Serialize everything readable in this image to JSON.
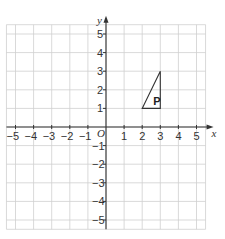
{
  "diagram": {
    "type": "coordinate-grid",
    "x_axis": {
      "label": "x",
      "min": -5,
      "max": 5,
      "ticks": [
        "-5",
        "-4",
        "-3",
        "-2",
        "-1",
        "1",
        "2",
        "3",
        "4",
        "5"
      ]
    },
    "y_axis": {
      "label": "y",
      "min": -5,
      "max": 5,
      "ticks": [
        "5",
        "4",
        "3",
        "2",
        "1",
        "-1",
        "-2",
        "-3",
        "-4",
        "-5"
      ]
    },
    "origin_label": "O",
    "shapes": [
      {
        "name": "P",
        "label": "P",
        "vertices": [
          [
            2,
            1
          ],
          [
            3,
            1
          ],
          [
            3,
            3
          ]
        ]
      }
    ]
  }
}
